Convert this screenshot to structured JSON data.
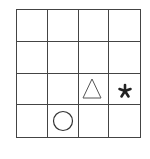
{
  "grid": {
    "rows": 4,
    "cols": 4,
    "line_color": "#444444",
    "cells": [
      [
        null,
        null,
        null,
        null
      ],
      [
        null,
        null,
        null,
        null
      ],
      [
        null,
        null,
        "triangle",
        "asterisk"
      ],
      [
        null,
        "circle",
        null,
        null
      ]
    ]
  },
  "symbols": {
    "triangle": {
      "name": "triangle-icon",
      "style": "outline",
      "row": 3,
      "col": 3
    },
    "asterisk": {
      "name": "asterisk-icon",
      "style": "filled",
      "glyph": "*",
      "row": 3,
      "col": 4
    },
    "circle": {
      "name": "circle-icon",
      "style": "outline",
      "row": 4,
      "col": 2
    }
  }
}
